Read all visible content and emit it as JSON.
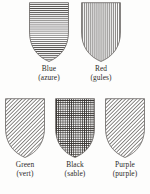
{
  "figure": {
    "background_color": "#fdfdfc",
    "ink_color": "#2e2b29",
    "outline_color": "#6f6c69",
    "hatch_color": "#4a4744",
    "type": "heraldic-tincture-hatching-chart"
  },
  "rows": [
    {
      "id": "row-top",
      "shields": [
        {
          "name": "Blue",
          "term": "(azure)",
          "hatching": "horizontal-lines",
          "pattern_id": "hatch-horizontal"
        },
        {
          "name": "Red",
          "term": "(gules)",
          "hatching": "vertical-lines",
          "pattern_id": "hatch-vertical"
        }
      ]
    },
    {
      "id": "row-bottom",
      "shields": [
        {
          "name": "Green",
          "term": "(vert)",
          "hatching": "diagonal-lines-bendwise",
          "pattern_id": "hatch-diagonal"
        },
        {
          "name": "Black",
          "term": "(sable)",
          "hatching": "cross-hatch-grid",
          "pattern_id": "hatch-grid"
        },
        {
          "name": "Purple",
          "term": "(purple)",
          "hatching": "diagonal-lines-bendwise",
          "pattern_id": "hatch-diagonal"
        }
      ]
    }
  ]
}
